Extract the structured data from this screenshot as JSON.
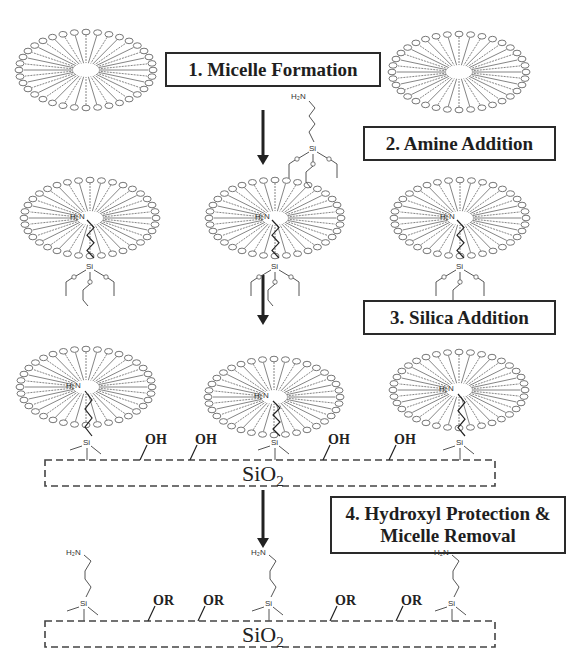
{
  "figure": {
    "colors": {
      "line": "#555555",
      "dark": "#222222",
      "box_border": "#2a2a2a"
    }
  },
  "steps": [
    {
      "id": "step1",
      "label": "1. Micelle Formation",
      "box": {
        "x": 165,
        "y": 52,
        "w": 216,
        "h": 35
      }
    },
    {
      "id": "step2",
      "label": "2. Amine Addition",
      "box": {
        "x": 363,
        "y": 126,
        "w": 193,
        "h": 35
      }
    },
    {
      "id": "step3",
      "label": "3. Silica Addition",
      "box": {
        "x": 363,
        "y": 300,
        "w": 193,
        "h": 35
      }
    },
    {
      "id": "step4",
      "label": "4. Hydroxyl Protection & Micelle Removal",
      "line1": "4. Hydroxyl Protection &",
      "line2": "Micelle Removal",
      "box": {
        "x": 330,
        "y": 496,
        "w": 236,
        "h": 58
      }
    }
  ],
  "arrows": [
    {
      "x": 263,
      "y1": 110,
      "y2": 165
    },
    {
      "x": 263,
      "y1": 275,
      "y2": 325
    },
    {
      "x": 263,
      "y1": 490,
      "y2": 548
    }
  ],
  "micelles": [
    {
      "row": 1,
      "cx": 86,
      "cy": 70,
      "rx": 71,
      "ry": 42,
      "core": "empty"
    },
    {
      "row": 1,
      "cx": 459,
      "cy": 72,
      "rx": 71,
      "ry": 42,
      "core": "empty"
    },
    {
      "row": 2,
      "cx": 90,
      "cy": 218,
      "rx": 70,
      "ry": 42,
      "core": "H2N"
    },
    {
      "row": 2,
      "cx": 275,
      "cy": 218,
      "rx": 70,
      "ry": 42,
      "core": "H2N"
    },
    {
      "row": 2,
      "cx": 460,
      "cy": 218,
      "rx": 70,
      "ry": 42,
      "core": "H2N"
    },
    {
      "row": 3,
      "cx": 86,
      "cy": 387,
      "rx": 70,
      "ry": 42,
      "core": "H2N"
    },
    {
      "row": 3,
      "cx": 274,
      "cy": 397,
      "rx": 70,
      "ry": 42,
      "core": "H2N"
    },
    {
      "row": 3,
      "cx": 459,
      "cy": 390,
      "rx": 70,
      "ry": 42,
      "core": "H2N"
    }
  ],
  "free_silane": {
    "x": 305,
    "y": 98,
    "amine_label": "H2N",
    "si_label": "Si",
    "o_label": "O"
  },
  "silica_slabs": [
    {
      "id": "slab1",
      "x": 45,
      "y": 460,
      "w": 450,
      "h": 26,
      "label": "SiO",
      "sub": "2",
      "label_x": 262,
      "label_y": 462
    },
    {
      "id": "slab2",
      "x": 45,
      "y": 621,
      "w": 450,
      "h": 26,
      "label": "SiO",
      "sub": "2",
      "label_x": 262,
      "label_y": 623
    }
  ],
  "surface_groups_row3": [
    {
      "type": "silane",
      "x": 83
    },
    {
      "type": "OH",
      "x": 140,
      "label": "OH"
    },
    {
      "type": "OH",
      "x": 190,
      "label": "OH"
    },
    {
      "type": "silane",
      "x": 276
    },
    {
      "type": "OH",
      "x": 323,
      "label": "OH"
    },
    {
      "type": "OH",
      "x": 389,
      "label": "OH"
    },
    {
      "type": "silane",
      "x": 459
    }
  ],
  "surface_groups_row4": [
    {
      "type": "aminosilane",
      "x": 83,
      "amine_label": "H2N"
    },
    {
      "type": "OR",
      "x": 148,
      "label": "OR"
    },
    {
      "type": "OR",
      "x": 198,
      "label": "OR"
    },
    {
      "type": "aminosilane",
      "x": 268,
      "amine_label": "H2N"
    },
    {
      "type": "OR",
      "x": 330,
      "label": "OR"
    },
    {
      "type": "OR",
      "x": 396,
      "label": "OR"
    },
    {
      "type": "aminosilane",
      "x": 451,
      "amine_label": "H2N"
    }
  ],
  "labels": {
    "si": "Si",
    "h2n": "H₂N",
    "sio": "SiO",
    "two": "2"
  }
}
